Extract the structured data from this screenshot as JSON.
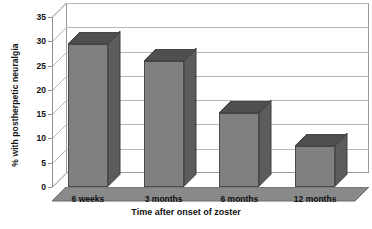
{
  "chart_data": {
    "type": "bar",
    "title": "",
    "xlabel": "Time after onset of zoster",
    "ylabel": "% with postherpetic neuralgia",
    "categories": [
      "6 weeks",
      "3 months",
      "6 months",
      "12 months"
    ],
    "values": [
      29.5,
      26,
      15.3,
      8.5
    ],
    "ylim": [
      0,
      35
    ],
    "yticks": [
      0,
      5,
      10,
      15,
      20,
      25,
      30,
      35
    ],
    "ytick_labels": [
      "0",
      "5",
      "10",
      "15",
      "20",
      "25",
      "30",
      "35"
    ],
    "grid": true,
    "legend": "none",
    "style": "3d-column",
    "colors": {
      "bar_front": "#808080",
      "bar_side": "#5c5c5c",
      "bar_top": "#4f4f4f",
      "gridline": "#b6b6b6",
      "axis": "#8d8d8d",
      "plot_background": "#ffffff",
      "text": "#111111"
    }
  }
}
